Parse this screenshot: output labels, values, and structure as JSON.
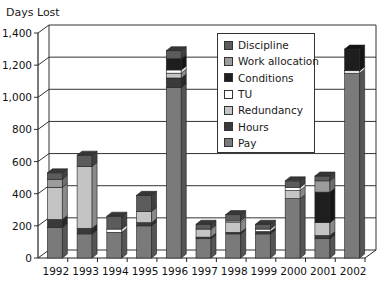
{
  "chart_data": {
    "type": "bar",
    "stacked": true,
    "style": "3d",
    "title": "",
    "ylabel": "Days Lost",
    "xlabel": "",
    "ylim": [
      0,
      1400
    ],
    "yticks": [
      0,
      200,
      400,
      600,
      800,
      1000,
      1200,
      1400
    ],
    "ytick_labels": [
      "0",
      "200",
      "400",
      "600",
      "800",
      "1,000",
      "1,200",
      "1,400"
    ],
    "grid": true,
    "legend_position": "upper-right-inside",
    "categories": [
      "1992",
      "1993",
      "1994",
      "1995",
      "1996",
      "1997",
      "1998",
      "1999",
      "2000",
      "2001",
      "2002"
    ],
    "series": [
      {
        "name": "Pay",
        "color": "#7a7a7a",
        "values": [
          190,
          150,
          160,
          200,
          1060,
          120,
          150,
          150,
          370,
          120,
          1150
        ]
      },
      {
        "name": "Hours",
        "color": "#3a3a3a",
        "values": [
          50,
          35,
          0,
          20,
          60,
          10,
          10,
          15,
          0,
          20,
          0
        ]
      },
      {
        "name": "Redundancy",
        "color": "#c4c4c4",
        "values": [
          200,
          385,
          0,
          70,
          30,
          50,
          60,
          0,
          50,
          80,
          0
        ]
      },
      {
        "name": "TU",
        "color": "#ffffff",
        "values": [
          0,
          0,
          20,
          0,
          20,
          0,
          10,
          15,
          20,
          0,
          15
        ]
      },
      {
        "name": "Conditions",
        "color": "#1e1e1e",
        "values": [
          0,
          0,
          0,
          0,
          70,
          0,
          0,
          0,
          0,
          190,
          135
        ]
      },
      {
        "name": "Work allocation",
        "color": "#9c9c9c",
        "values": [
          50,
          0,
          0,
          0,
          0,
          0,
          0,
          0,
          0,
          70,
          0
        ]
      },
      {
        "name": "Discipline",
        "color": "#5c5c5c",
        "values": [
          40,
          70,
          80,
          100,
          50,
          30,
          40,
          30,
          40,
          30,
          0
        ]
      }
    ]
  },
  "legend": {
    "items": [
      {
        "label": "Discipline",
        "color": "#5c5c5c"
      },
      {
        "label": "Work allocation",
        "color": "#9c9c9c"
      },
      {
        "label": "Conditions",
        "color": "#1e1e1e"
      },
      {
        "label": "TU",
        "color": "#ffffff"
      },
      {
        "label": "Redundancy",
        "color": "#c4c4c4"
      },
      {
        "label": "Hours",
        "color": "#3a3a3a"
      },
      {
        "label": "Pay",
        "color": "#7a7a7a"
      }
    ]
  }
}
